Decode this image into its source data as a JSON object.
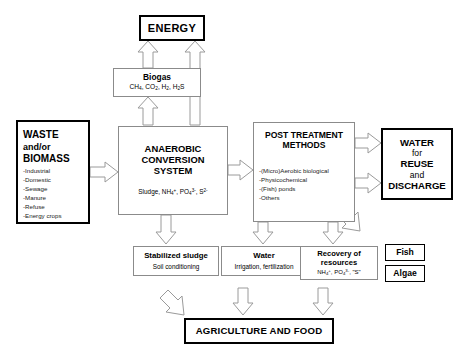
{
  "diagram": {
    "nodes": {
      "energy": {
        "label": "ENERGY"
      },
      "biogas": {
        "title": "Biogas",
        "formula": "CH4, CO2, H2, H2S"
      },
      "waste": {
        "line1": "WASTE",
        "line2": "and/or",
        "line3": "BIOMASS",
        "items": [
          "-Industrial",
          "-Domestic",
          "-Sewage",
          "-Manure",
          "-Refuse",
          "-Energy crops"
        ]
      },
      "anaerobic": {
        "line1": "ANAEROBIC",
        "line2": "CONVERSION",
        "line3": "SYSTEM",
        "formula": "Sludge, NH4+, PO43-, S2-"
      },
      "post_treatment": {
        "line1": "POST TREATMENT",
        "line2": "METHODS",
        "items": [
          "-(Micro)Aerobic biological",
          "-Physicochemical",
          "-(Fish) ponds",
          "-Others"
        ]
      },
      "water_reuse": {
        "line1": "WATER",
        "line2": "for",
        "line3": "REUSE",
        "line4": "and",
        "line5": "DISCHARGE"
      },
      "stabilized_sludge": {
        "title": "Stabilized sludge",
        "sub": "Soil conditioning"
      },
      "water_product": {
        "title": "Water",
        "sub": "Irrigation, fertilization"
      },
      "recovery": {
        "title1": "Recovery of",
        "title2": "resources",
        "formula": "NH4+, PO43-, \"S\""
      },
      "fish": {
        "label": "Fish"
      },
      "algae": {
        "label": "Algae"
      },
      "agriculture": {
        "label": "AGRICULTURE AND FOOD"
      }
    },
    "colors": {
      "outline_thin": "#8b8b8b",
      "outline_thick": "#000000",
      "arrow_stroke": "#9a9a9a",
      "background": "#ffffff"
    }
  }
}
